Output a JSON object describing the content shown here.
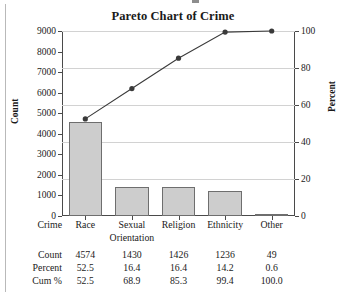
{
  "chart_data": {
    "type": "bar",
    "title": "Pareto Chart of Crime",
    "categories": [
      "Race",
      "Sexual Orientation",
      "Religion",
      "Ethnicity",
      "Other"
    ],
    "values": [
      4574,
      1430,
      1426,
      1236,
      49
    ],
    "series": [
      {
        "name": "Count",
        "type": "bar",
        "values": [
          4574,
          1430,
          1426,
          1236,
          49
        ]
      },
      {
        "name": "Cum %",
        "type": "line",
        "values": [
          52.5,
          68.9,
          85.3,
          99.4,
          100.0
        ]
      }
    ],
    "xlabel": "Crime",
    "ylabel": "Count",
    "y2label": "Percent",
    "ylim": [
      0,
      9000
    ],
    "y2lim": [
      0,
      100
    ],
    "yticks": [
      0,
      1000,
      2000,
      3000,
      4000,
      5000,
      6000,
      7000,
      8000,
      9000
    ],
    "y2ticks": [
      0,
      20,
      40,
      60,
      80,
      100
    ],
    "grid": true,
    "legend": "none",
    "bar_color": "#cdcdcd",
    "bar_border_color": "#6e6e6e",
    "line_color": "#3a3a3a",
    "marker": "filled-circle"
  },
  "chart": {
    "title": "Pareto Chart of Crime",
    "y_axis_left": {
      "name": "Count",
      "ticks": [
        "0",
        "1000",
        "2000",
        "3000",
        "4000",
        "5000",
        "6000",
        "7000",
        "8000",
        "9000"
      ]
    },
    "y_axis_right": {
      "name": "Percent",
      "ticks": [
        "0",
        "20",
        "40",
        "60",
        "80",
        "100"
      ]
    }
  },
  "table": {
    "rows": [
      {
        "label": "Crime",
        "cells": [
          "Race",
          "Sexual",
          "Religion",
          "Ethnicity",
          "Other"
        ]
      },
      {
        "label": "",
        "cells": [
          "",
          "Orientation",
          "",
          "",
          ""
        ]
      },
      {
        "label": "Count",
        "cells": [
          "4574",
          "1430",
          "1426",
          "1236",
          "49"
        ]
      },
      {
        "label": "Percent",
        "cells": [
          "52.5",
          "16.4",
          "16.4",
          "14.2",
          "0.6"
        ]
      },
      {
        "label": "Cum %",
        "cells": [
          "52.5",
          "68.9",
          "85.3",
          "99.4",
          "100.0"
        ]
      }
    ]
  }
}
